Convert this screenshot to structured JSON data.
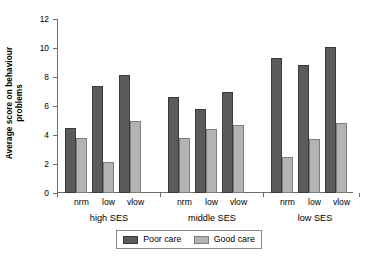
{
  "chart_data": {
    "type": "bar",
    "title": "",
    "xlabel": "",
    "ylabel": "Average score on behaviour problems",
    "ylabel_line1": "Average score on behaviour",
    "ylabel_line2": "problems",
    "ylim": [
      0,
      12
    ],
    "yticks": [
      0,
      2,
      4,
      6,
      8,
      10,
      12
    ],
    "ytick_labels": [
      "0",
      "2",
      "4",
      "6",
      "8",
      "10",
      "12"
    ],
    "grid": false,
    "legend_position": "bottom",
    "categories": [
      "nrm",
      "low",
      "vlow",
      "nrm",
      "low",
      "vlow",
      "nrm",
      "low",
      "vlow"
    ],
    "groups": [
      {
        "label": "high SES",
        "categories": [
          "nrm",
          "low",
          "vlow"
        ],
        "poor_care": [
          4.5,
          7.35,
          8.15
        ],
        "good_care": [
          3.8,
          2.15,
          5.0
        ]
      },
      {
        "label": "middle SES",
        "categories": [
          "nrm",
          "low",
          "vlow"
        ],
        "poor_care": [
          6.65,
          5.8,
          7.0
        ],
        "good_care": [
          3.8,
          4.4,
          4.7
        ]
      },
      {
        "label": "low SES",
        "categories": [
          "nrm",
          "low",
          "vlow"
        ],
        "poor_care": [
          9.3,
          8.85,
          10.1
        ],
        "good_care": [
          2.5,
          3.7,
          4.85
        ]
      }
    ],
    "series": [
      {
        "name": "Poor care",
        "color": "#5b5b5b",
        "values": [
          4.5,
          7.35,
          8.15,
          6.65,
          5.8,
          7.0,
          9.3,
          8.85,
          10.1
        ]
      },
      {
        "name": "Good care",
        "color": "#b3b3b3",
        "values": [
          3.8,
          2.15,
          5.0,
          3.8,
          4.4,
          4.7,
          2.5,
          3.7,
          4.85
        ]
      }
    ]
  },
  "legend": {
    "items": [
      {
        "label": "Poor care",
        "color": "#5b5b5b"
      },
      {
        "label": "Good care",
        "color": "#b3b3b3"
      }
    ]
  }
}
